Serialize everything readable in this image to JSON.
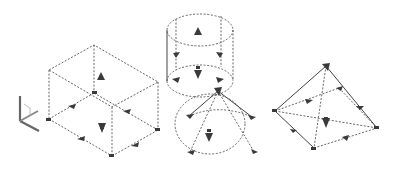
{
  "colors": {
    "background": "#ffffff",
    "edges": "#555555",
    "grips": "#3a3a3a"
  },
  "ucs_icon": {
    "name": "ucs-icon",
    "x": 20,
    "y": 96
  },
  "shapes": [
    {
      "name": "box",
      "label": "Box"
    },
    {
      "name": "cylinder",
      "label": "Cylinder"
    },
    {
      "name": "cone",
      "label": "Cone"
    },
    {
      "name": "pyramid",
      "label": "Pyramid"
    }
  ]
}
